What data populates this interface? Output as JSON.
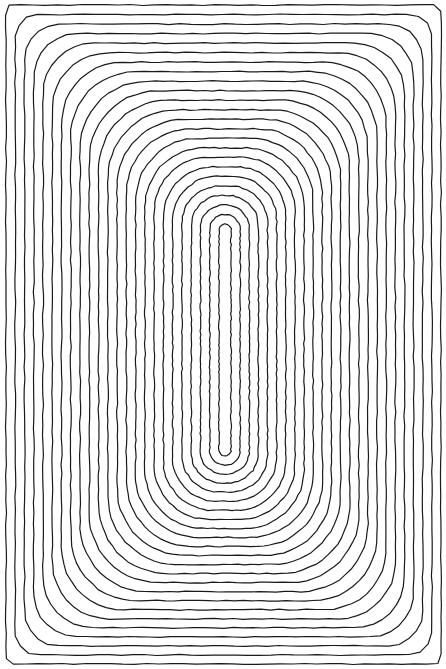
{
  "artwork": {
    "title": "",
    "description": "Hand-drawn concentric rounded-rectangle line artwork",
    "width": 446,
    "height": 669,
    "background": "#ffffff",
    "stroke_color": "#1a1a1a",
    "stroke_width": 1.2,
    "center": {
      "x": 224.5,
      "y": 340
    },
    "outer": {
      "x0": 6,
      "y0": 5,
      "x1": 441,
      "y1": 664,
      "corner_radius": 3
    },
    "inner": {
      "x0": 219,
      "y0": 224,
      "x1": 231,
      "y1": 456,
      "corner_radius": 6
    },
    "loop_count": 24,
    "wobble": 1.1
  }
}
